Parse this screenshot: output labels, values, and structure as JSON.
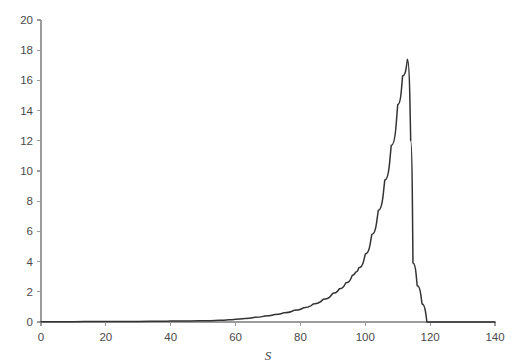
{
  "figure": {
    "background_color": "#ffffff",
    "axis_color": "#9b9b9b",
    "curve_color": "#333333",
    "tick_label_color": "#4a4a4a"
  },
  "chart_data": {
    "type": "line",
    "title": "",
    "subtitle": "",
    "xlabel": "S",
    "ylabel": "",
    "xlim": [
      0,
      140
    ],
    "ylim": [
      0,
      20
    ],
    "xticks": [
      0,
      20,
      40,
      60,
      80,
      100,
      120,
      140
    ],
    "yticks": [
      0,
      2,
      4,
      6,
      8,
      10,
      12,
      14,
      16,
      18,
      20
    ],
    "xtick_labels": [
      "0",
      "20",
      "40",
      "60",
      "80",
      "100",
      "120",
      "140"
    ],
    "ytick_labels": [
      "0",
      "2",
      "4",
      "6",
      "8",
      "10",
      "12",
      "14",
      "16",
      "18",
      "20"
    ],
    "grid": false,
    "legend": null,
    "legend_position": "none",
    "annotations": [],
    "series": [
      {
        "name": "distribution",
        "style": "solid",
        "color": "#333333",
        "line_width": 1.5,
        "peak_x": 113,
        "peak_y": 17.4,
        "x": [
          0,
          5,
          10,
          15,
          20,
          25,
          30,
          35,
          40,
          45,
          50,
          55,
          58,
          60,
          63,
          66,
          69,
          72,
          75,
          78,
          81,
          84,
          87,
          90,
          92,
          94,
          96,
          97,
          98,
          100,
          102,
          104,
          106,
          108,
          110,
          111.5,
          113,
          114,
          114.7,
          116,
          117.5,
          119,
          140
        ],
        "y": [
          0.02,
          0.02,
          0.02,
          0.03,
          0.03,
          0.04,
          0.04,
          0.05,
          0.06,
          0.07,
          0.09,
          0.12,
          0.15,
          0.18,
          0.24,
          0.31,
          0.4,
          0.5,
          0.62,
          0.77,
          0.95,
          1.2,
          1.5,
          1.9,
          2.2,
          2.6,
          3.1,
          3.3,
          3.6,
          4.5,
          5.8,
          7.4,
          9.4,
          11.7,
          14.4,
          16.3,
          17.4,
          12.0,
          3.9,
          2.4,
          1.2,
          0.0,
          0.0
        ]
      }
    ]
  },
  "geometry": {
    "origin_px": [
      41,
      322
    ],
    "x_px_per_unit": 3.243,
    "y_px_per_unit": 15.1
  }
}
